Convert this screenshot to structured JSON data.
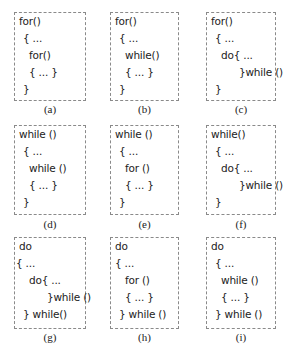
{
  "figure": {
    "panels": [
      {
        "id": "a",
        "label": "(a)",
        "lines": [
          {
            "text": "for()",
            "indent": 0
          },
          {
            "text": "{ ...",
            "indent": 1
          },
          {
            "text": "for()",
            "indent": 2
          },
          {
            "text": "{ ... }",
            "indent": 2
          },
          {
            "text": "}",
            "indent": 1
          }
        ]
      },
      {
        "id": "b",
        "label": "(b)",
        "lines": [
          {
            "text": "for()",
            "indent": 0
          },
          {
            "text": "{ ...",
            "indent": 1
          },
          {
            "text": "while()",
            "indent": 2
          },
          {
            "text": "{ ... }",
            "indent": 2
          },
          {
            "text": "}",
            "indent": 1
          }
        ]
      },
      {
        "id": "c",
        "label": "(c)",
        "lines": [
          {
            "text": "for()",
            "indent": 0
          },
          {
            "text": "{ ...",
            "indent": 1
          },
          {
            "text": "do{ ...",
            "indent": 2
          },
          {
            "text": "}while ()",
            "indent": 3
          },
          {
            "text": "}",
            "indent": 1
          }
        ]
      },
      {
        "id": "d",
        "label": "(d)",
        "lines": [
          {
            "text": "while ()",
            "indent": 0
          },
          {
            "text": "{ ...",
            "indent": 1
          },
          {
            "text": "while ()",
            "indent": 2
          },
          {
            "text": "{ ... }",
            "indent": 2
          },
          {
            "text": "}",
            "indent": 1
          }
        ]
      },
      {
        "id": "e",
        "label": "(e)",
        "lines": [
          {
            "text": "while ()",
            "indent": 0
          },
          {
            "text": "{ ...",
            "indent": 1
          },
          {
            "text": "for ()",
            "indent": 2
          },
          {
            "text": "{ ... }",
            "indent": 2
          },
          {
            "text": "}",
            "indent": 1
          }
        ]
      },
      {
        "id": "f",
        "label": "(f)",
        "lines": [
          {
            "text": "while()",
            "indent": 0
          },
          {
            "text": "{ ...",
            "indent": 1
          },
          {
            "text": "do{ ...",
            "indent": 2
          },
          {
            "text": "}while ()",
            "indent": 3
          },
          {
            "text": "}",
            "indent": 1
          }
        ]
      },
      {
        "id": "g",
        "label": "(g)",
        "lines": [
          {
            "text": "do",
            "indent": 0
          },
          {
            "text": "{ ...",
            "indent": -1
          },
          {
            "text": "do{ ...",
            "indent": 2
          },
          {
            "text": "}while ()",
            "indent": 3
          },
          {
            "text": "} while()",
            "indent": 1
          }
        ]
      },
      {
        "id": "h",
        "label": "(h)",
        "lines": [
          {
            "text": "do",
            "indent": 0
          },
          {
            "text": "{ ...",
            "indent": 0
          },
          {
            "text": "for ()",
            "indent": 2
          },
          {
            "text": "{ ... }",
            "indent": 2
          },
          {
            "text": "} while ()",
            "indent": 1
          }
        ]
      },
      {
        "id": "i",
        "label": "(i)",
        "lines": [
          {
            "text": "do",
            "indent": 0
          },
          {
            "text": "{ ...",
            "indent": 1
          },
          {
            "text": "while ()",
            "indent": 2
          },
          {
            "text": "{ ... }",
            "indent": 2
          },
          {
            "text": "} while ()",
            "indent": 1
          }
        ]
      }
    ]
  }
}
